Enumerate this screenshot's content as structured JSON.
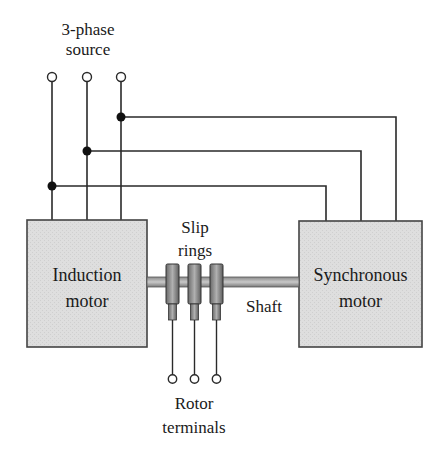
{
  "diagram": {
    "source_label_line1": "3-phase",
    "source_label_line2": "source",
    "induction_label_line1": "Induction",
    "induction_label_line2": "motor",
    "synchronous_label_line1": "Synchronous",
    "synchronous_label_line2": "motor",
    "slip_label_line1": "Slip",
    "slip_label_line2": "rings",
    "shaft_label": "Shaft",
    "rotor_label_line1": "Rotor",
    "rotor_label_line2": "terminals",
    "colors": {
      "line": "#2a2a2a",
      "box_fill": "#dcdcdc",
      "box_border": "#444444",
      "shaft_fill": "#9a9a9a",
      "ring_fill": "#7a7a7a"
    }
  }
}
